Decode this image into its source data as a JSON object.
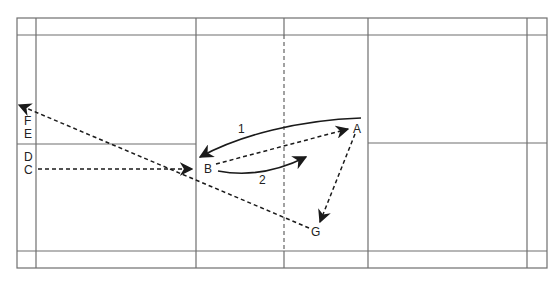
{
  "diagram": {
    "type": "badminton-court-movement",
    "colors": {
      "court_line": "#6f6f6f",
      "path": "#1a1a1a",
      "background": "#ffffff"
    },
    "positions": [
      {
        "id": "A",
        "x": 357,
        "y": 131
      },
      {
        "id": "B",
        "x": 208,
        "y": 169
      },
      {
        "id": "C",
        "x": 28,
        "y": 170
      },
      {
        "id": "D",
        "x": 28,
        "y": 157
      },
      {
        "id": "E",
        "x": 28,
        "y": 133
      },
      {
        "id": "F",
        "x": 28,
        "y": 120
      },
      {
        "id": "G",
        "x": 315,
        "y": 232
      }
    ],
    "path_labels": [
      {
        "id": "1",
        "x": 240,
        "y": 128
      },
      {
        "id": "2",
        "x": 262,
        "y": 179
      }
    ],
    "paths": [
      {
        "from": "A",
        "to": "B",
        "style": "solid",
        "label": "1"
      },
      {
        "from": "B",
        "to": "toward-A-mid",
        "style": "solid",
        "label": "2"
      },
      {
        "from": "B",
        "to": "A",
        "style": "dashed"
      },
      {
        "from": "C",
        "to": "B",
        "style": "dashed"
      },
      {
        "from": "G",
        "to": "F",
        "style": "dashed"
      },
      {
        "from": "A",
        "to": "G",
        "style": "dashed"
      }
    ]
  }
}
